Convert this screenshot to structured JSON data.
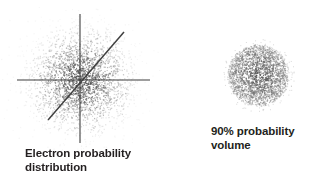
{
  "figure": {
    "background_color": "#ffffff",
    "ink_color": "#231f20",
    "dot_color": "#555555",
    "axis_color": "#3f3f3f"
  },
  "panels": {
    "left": {
      "caption": "Electron probability\ndistribution",
      "caption_line1": "Electron probability",
      "caption_line2": "distribution",
      "description": "Dense Gaussian scatter cloud of dots representing electron probability density, crossed by a vertical axis, a horizontal axis and a diagonal line through the origin.",
      "center": {
        "x": 80,
        "y": 80
      },
      "dot_count": 2600,
      "sigma": 26,
      "axes": [
        {
          "name": "vertical-axis",
          "x1": 80,
          "y1": 14,
          "x2": 80,
          "y2": 143
        },
        {
          "name": "horizontal-axis",
          "x1": 17,
          "y1": 80,
          "x2": 150,
          "y2": 80
        },
        {
          "name": "diagonal-axis",
          "x1": 48,
          "y1": 120,
          "x2": 124,
          "y2": 32
        }
      ]
    },
    "right": {
      "caption": "90% probability\nvolume",
      "caption_line1": "90% probability",
      "caption_line2": "volume",
      "description": "Uniformly dense circular cloud of dots with a sharp boundary representing the 90% probability volume.",
      "center": {
        "x": 62,
        "y": 45
      },
      "radius": 31,
      "dot_count": 2400,
      "axes": []
    }
  }
}
